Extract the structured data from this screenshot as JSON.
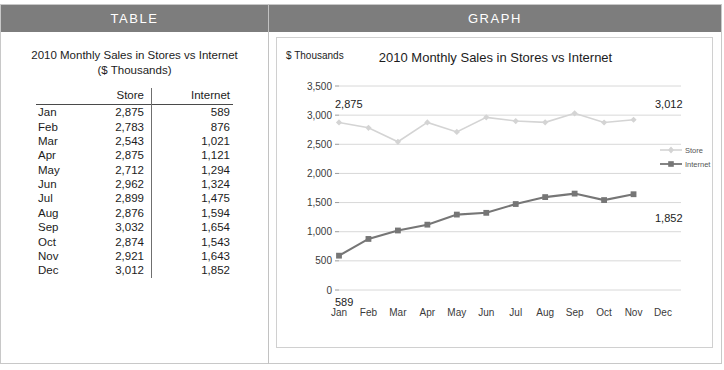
{
  "panels": {
    "table_header": "TABLE",
    "graph_header": "GRAPH"
  },
  "table": {
    "title_line1": "2010 Monthly Sales in Stores vs Internet",
    "title_line2": "($ Thousands)",
    "columns": [
      "",
      "Store",
      "Internet"
    ],
    "rows": [
      {
        "month": "Jan",
        "store": "2,875",
        "internet": "589"
      },
      {
        "month": "Feb",
        "store": "2,783",
        "internet": "876"
      },
      {
        "month": "Mar",
        "store": "2,543",
        "internet": "1,021"
      },
      {
        "month": "Apr",
        "store": "2,875",
        "internet": "1,121"
      },
      {
        "month": "May",
        "store": "2,712",
        "internet": "1,294"
      },
      {
        "month": "Jun",
        "store": "2,962",
        "internet": "1,324"
      },
      {
        "month": "Jul",
        "store": "2,899",
        "internet": "1,475"
      },
      {
        "month": "Aug",
        "store": "2,876",
        "internet": "1,594"
      },
      {
        "month": "Sep",
        "store": "3,032",
        "internet": "1,654"
      },
      {
        "month": "Oct",
        "store": "2,874",
        "internet": "1,543"
      },
      {
        "month": "Nov",
        "store": "2,921",
        "internet": "1,643"
      },
      {
        "month": "Dec",
        "store": "3,012",
        "internet": "1,852"
      }
    ]
  },
  "chart_data": {
    "type": "line",
    "title": "2010 Monthly Sales in Stores vs Internet",
    "ylabel": "$ Thousands",
    "xlabel": "",
    "categories": [
      "Jan",
      "Feb",
      "Mar",
      "Apr",
      "May",
      "Jun",
      "Jul",
      "Aug",
      "Sep",
      "Oct",
      "Nov",
      "Dec"
    ],
    "yticks": [
      "0",
      "500",
      "1,000",
      "1,500",
      "2,000",
      "2,500",
      "3,000",
      "3,500"
    ],
    "ylim": [
      0,
      3500
    ],
    "grid": true,
    "legend_position": "right",
    "series": [
      {
        "name": "Store",
        "color": "#d4d4d4",
        "marker": "diamond",
        "values": [
          2875,
          2783,
          2543,
          2875,
          2712,
          2962,
          2899,
          2876,
          3032,
          2874,
          2921,
          3012
        ]
      },
      {
        "name": "Internet",
        "color": "#767676",
        "marker": "square",
        "values": [
          589,
          876,
          1021,
          1121,
          1294,
          1324,
          1475,
          1594,
          1654,
          1543,
          1643,
          1852
        ]
      }
    ],
    "annotations": [
      {
        "text": "2,875",
        "series": "Store",
        "point": "Jan"
      },
      {
        "text": "3,012",
        "series": "Store",
        "point": "Dec"
      },
      {
        "text": "589",
        "series": "Internet",
        "point": "Jan"
      },
      {
        "text": "1,852",
        "series": "Internet",
        "point": "Dec"
      }
    ]
  },
  "colors": {
    "header_bar": "#7d7d7d",
    "store_line": "#d4d4d4",
    "internet_line": "#767676",
    "gridline": "#d8d8d8"
  }
}
